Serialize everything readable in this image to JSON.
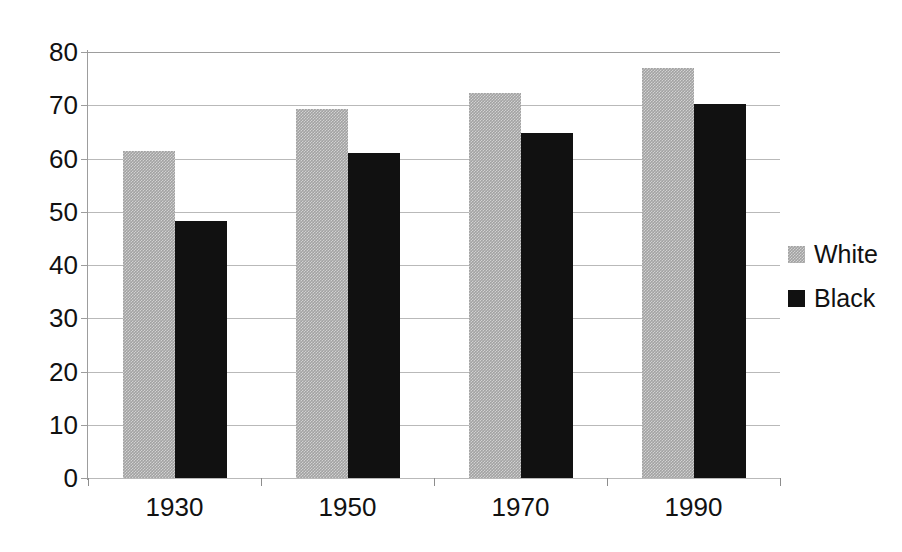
{
  "chart_data": {
    "type": "bar",
    "title": "",
    "subtitle": "",
    "xlabel": "",
    "ylabel": "",
    "categories": [
      "1930",
      "1950",
      "1970",
      "1990"
    ],
    "series": [
      {
        "name": "White",
        "color": "#a2a2a2",
        "values": [
          61.4,
          69.3,
          72.3,
          77.0
        ]
      },
      {
        "name": "Black",
        "color": "#111111",
        "values": [
          48.3,
          61.0,
          64.7,
          70.3
        ]
      }
    ],
    "ylim": [
      0,
      80
    ],
    "ytick_step": 10,
    "yticks": [
      "0",
      "10",
      "20",
      "30",
      "40",
      "50",
      "60",
      "70",
      "80"
    ],
    "grid": true,
    "grid_axis": "y",
    "legend_position": "right",
    "bar_grouping": "grouped"
  },
  "legend": {
    "entries": [
      {
        "label": "White"
      },
      {
        "label": "Black"
      }
    ]
  }
}
